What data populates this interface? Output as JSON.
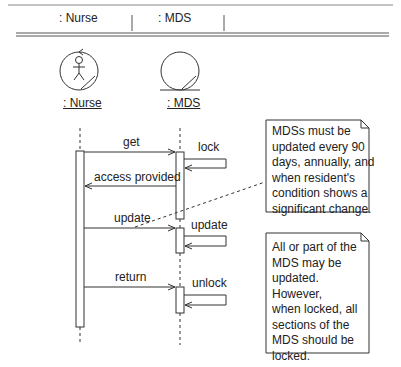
{
  "header": {
    "columns": [
      ": Nurse",
      ": MDS"
    ]
  },
  "objects": [
    {
      "name": ": Nurse",
      "type": "actor-boundary"
    },
    {
      "name": ": MDS",
      "type": "entity"
    }
  ],
  "messages": [
    {
      "label": "get",
      "from": ": Nurse",
      "to": ": MDS"
    },
    {
      "label": "lock",
      "from": ": MDS",
      "to": ": MDS"
    },
    {
      "label": "access provided",
      "from": ": MDS",
      "to": ": Nurse"
    },
    {
      "label": "update",
      "from": ": Nurse",
      "to": ": MDS"
    },
    {
      "label": "update",
      "from": ": MDS",
      "to": ": MDS"
    },
    {
      "label": "return",
      "from": ": Nurse",
      "to": ": MDS"
    },
    {
      "label": "unlock",
      "from": ": MDS",
      "to": ": MDS"
    }
  ],
  "notes": [
    {
      "lines": [
        "MDSs must be",
        "updated every 90",
        "days, annually, and",
        "when resident's",
        "condition shows a",
        "significant change."
      ]
    },
    {
      "lines": [
        "All or part of the",
        "MDS may be",
        "updated.",
        "However,",
        "when locked, all",
        "sections of the",
        "MDS should be",
        "locked."
      ]
    }
  ],
  "colors": {
    "line": "#333333",
    "background": "#ffffff"
  }
}
